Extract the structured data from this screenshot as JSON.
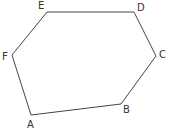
{
  "figure": {
    "type": "hexagon",
    "stroke_color": "#444444",
    "label_color": "#333333",
    "vertices": [
      {
        "name": "A",
        "x": 31,
        "y": 115,
        "label_x": 27,
        "label_y": 128
      },
      {
        "name": "B",
        "x": 121,
        "y": 104,
        "label_x": 123,
        "label_y": 113
      },
      {
        "name": "C",
        "x": 156,
        "y": 56,
        "label_x": 159,
        "label_y": 58
      },
      {
        "name": "D",
        "x": 134,
        "y": 12,
        "label_x": 137,
        "label_y": 11
      },
      {
        "name": "E",
        "x": 47,
        "y": 12,
        "label_x": 38,
        "label_y": 9
      },
      {
        "name": "F",
        "x": 12,
        "y": 55,
        "label_x": 2,
        "label_y": 60
      }
    ]
  }
}
